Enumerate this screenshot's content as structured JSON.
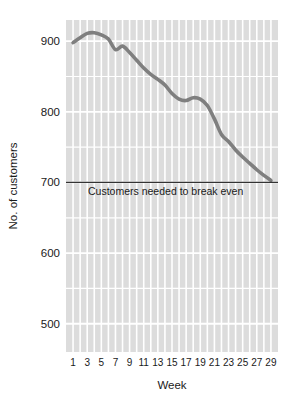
{
  "chart_data": {
    "type": "line",
    "title": "",
    "xlabel": "Week",
    "ylabel": "No. of customers",
    "xlim": [
      0,
      30
    ],
    "ylim": [
      460,
      930
    ],
    "grid": true,
    "legend_position": "none",
    "x_tick_labels": [
      "1",
      "3",
      "5",
      "7",
      "9",
      "11",
      "13",
      "15",
      "17",
      "19",
      "21",
      "23",
      "25",
      "27",
      "29"
    ],
    "x_tick_values": [
      1,
      3,
      5,
      7,
      9,
      11,
      13,
      15,
      17,
      19,
      21,
      23,
      25,
      27,
      29
    ],
    "y_tick_labels": [
      "500",
      "600",
      "700",
      "800",
      "900"
    ],
    "y_tick_values": [
      500,
      600,
      700,
      800,
      900
    ],
    "x": [
      1,
      2,
      3,
      4,
      5,
      6,
      7,
      8,
      9,
      10,
      11,
      12,
      13,
      14,
      15,
      16,
      17,
      18,
      19,
      20,
      21,
      22,
      23,
      24,
      25,
      26,
      27,
      28,
      29
    ],
    "series": [
      {
        "name": "No. of customers",
        "color": "#7f7f7f",
        "values": [
          898,
          905,
          911,
          912,
          909,
          903,
          888,
          893,
          884,
          873,
          862,
          853,
          846,
          838,
          826,
          818,
          816,
          820,
          818,
          809,
          790,
          768,
          758,
          746,
          736,
          727,
          718,
          710,
          703
        ]
      }
    ],
    "annotations": [
      {
        "name": "break-even-line",
        "type": "hline",
        "value": 700,
        "label": "Customers needed to break even",
        "color": "#333333"
      }
    ],
    "plot_bg_color": "#dcdcdc",
    "gridline_color": "#ffffff",
    "page_bg_color": "#ffffff"
  }
}
